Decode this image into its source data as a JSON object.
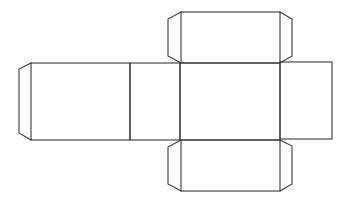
{
  "diagram": {
    "type": "box-net",
    "stroke_color": "#3a3a3a",
    "background": "#ffffff",
    "faces": [
      {
        "name": "side-left",
        "x": 31,
        "y": 63,
        "w": 99,
        "h": 77
      },
      {
        "name": "end-left",
        "x": 130,
        "y": 63,
        "w": 50,
        "h": 77
      },
      {
        "name": "front",
        "x": 180,
        "y": 63,
        "w": 100,
        "h": 77
      },
      {
        "name": "end-right",
        "x": 280,
        "y": 63,
        "w": 52,
        "h": 77
      },
      {
        "name": "top",
        "x": 180,
        "y": 12,
        "w": 100,
        "h": 51
      },
      {
        "name": "bottom",
        "x": 180,
        "y": 140,
        "w": 100,
        "h": 51
      }
    ],
    "flaps": [
      {
        "name": "glue-flap-left",
        "attached_to": "side-left"
      },
      {
        "name": "top-flap-left",
        "attached_to": "top"
      },
      {
        "name": "top-flap-right",
        "attached_to": "top"
      },
      {
        "name": "bottom-flap-left",
        "attached_to": "bottom"
      },
      {
        "name": "bottom-flap-right",
        "attached_to": "bottom"
      }
    ]
  }
}
